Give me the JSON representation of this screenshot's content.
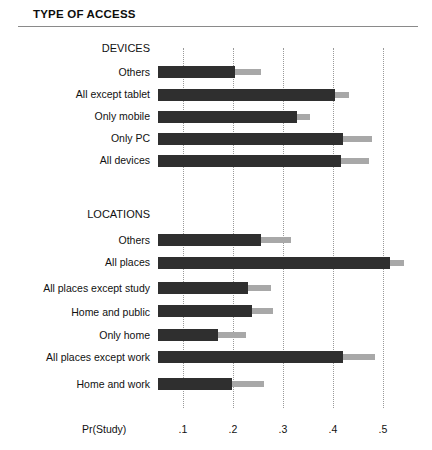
{
  "figure": {
    "title": "TYPE OF ACCESS",
    "axis_label": "Pr(Study)"
  },
  "chart_data": {
    "type": "bar",
    "orientation": "horizontal",
    "title": "TYPE OF ACCESS",
    "xlabel": "Pr(Study)",
    "ylabel": "",
    "xlim": [
      0.05,
      0.55
    ],
    "ticks": [
      ".1",
      ".2",
      ".3",
      ".4",
      ".5"
    ],
    "tick_values": [
      0.1,
      0.2,
      0.3,
      0.4,
      0.5
    ],
    "grid": "vertical-dotted",
    "legend": null,
    "colors": {
      "bar": "#2f2f2f",
      "interval": "#a8a8a8",
      "grid": "#9a9a9a",
      "rule": "#8a8a8a",
      "background": "#ffffff"
    },
    "groups": [
      {
        "name": "DEVICES",
        "categories": [
          "Others",
          "All except tablet",
          "Only mobile",
          "Only PC",
          "All devices"
        ],
        "values": [
          0.203,
          0.403,
          0.328,
          0.42,
          0.415
        ],
        "upper": [
          0.255,
          0.432,
          0.353,
          0.478,
          0.472
        ]
      },
      {
        "name": "LOCATIONS",
        "categories": [
          "Others",
          "All places",
          "All places except study",
          "Home and public",
          "Only home",
          "All places except work",
          "Home and work"
        ],
        "values": [
          0.255,
          0.513,
          0.23,
          0.238,
          0.17,
          0.42,
          0.198
        ],
        "upper": [
          0.315,
          0.541,
          0.275,
          0.28,
          0.225,
          0.483,
          0.262
        ]
      }
    ]
  }
}
